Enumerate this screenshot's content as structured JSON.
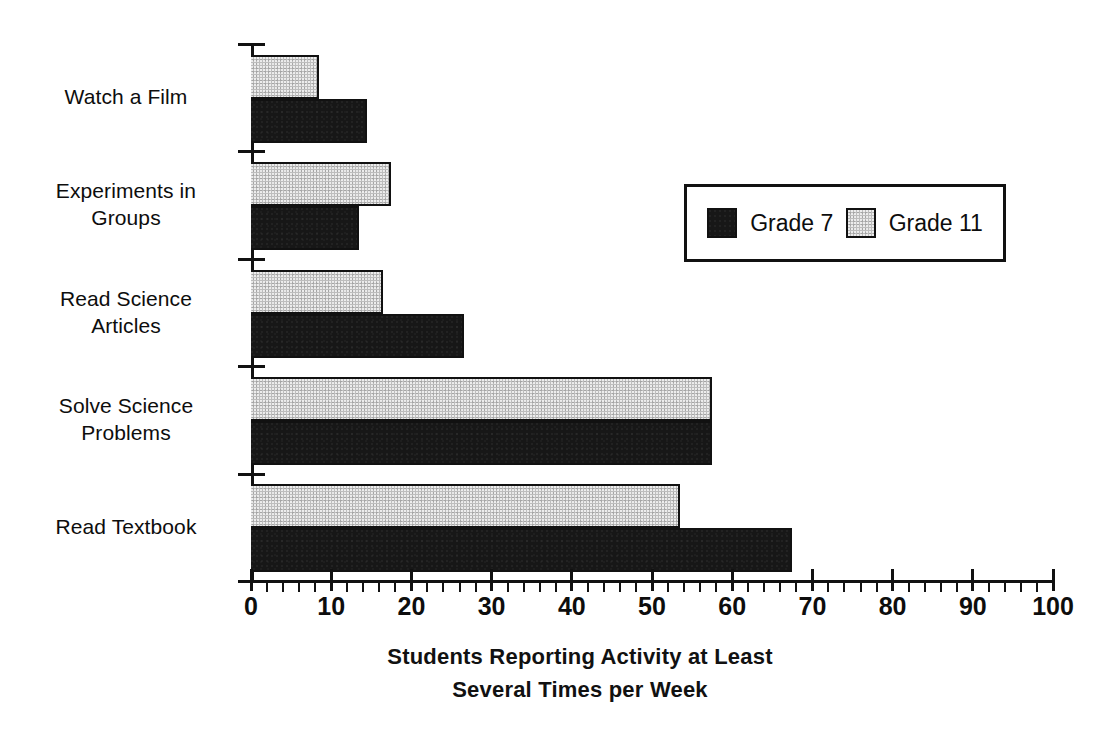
{
  "chart_data": {
    "type": "bar",
    "orientation": "horizontal",
    "title": "",
    "xlabel": "Students Reporting Activity at Least Several Times per Week",
    "xlabel_line1": "Students Reporting Activity at Least",
    "xlabel_line2": "Several Times per Week",
    "ylabel": "",
    "xlim": [
      0,
      100
    ],
    "xtick_step": 10,
    "xminor_step": 2,
    "grid": false,
    "legend_position": "upper right",
    "categories": [
      "Watch a Film",
      "Experiments in Groups",
      "Read Science Articles",
      "Solve Science Problems",
      "Read Textbook"
    ],
    "category_lines": [
      [
        "Watch a Film"
      ],
      [
        "Experiments in",
        "Groups"
      ],
      [
        "Read Science",
        "Articles"
      ],
      [
        "Solve Science",
        "Problems"
      ],
      [
        "Read Textbook"
      ]
    ],
    "tick_labels": [
      "0",
      "10",
      "20",
      "30",
      "40",
      "50",
      "60",
      "70",
      "80",
      "90",
      "100"
    ],
    "tick_values": [
      0,
      10,
      20,
      30,
      40,
      50,
      60,
      70,
      80,
      90,
      100
    ],
    "series": [
      {
        "name": "Grade 7",
        "color": "#171717",
        "values": [
          14.5,
          13.5,
          26.5,
          57.5,
          67.5
        ]
      },
      {
        "name": "Grade 11",
        "color": "#bdbdbd",
        "values": [
          8.5,
          17.5,
          16.5,
          57.5,
          53.5
        ]
      }
    ]
  },
  "legend": {
    "items": [
      {
        "label": "Grade 7",
        "swatch": "dark"
      },
      {
        "label": "Grade 11",
        "swatch": "light"
      }
    ]
  }
}
